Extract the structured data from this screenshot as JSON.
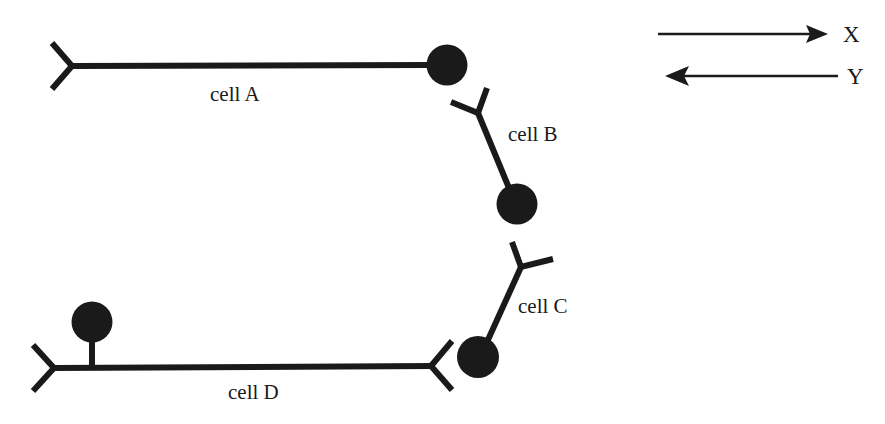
{
  "figure": {
    "background_color": "#ffffff",
    "ink_color": "#1a1a1a",
    "width": 885,
    "height": 424
  },
  "cells": [
    {
      "id": "cell-a",
      "label": "cell A",
      "label_x": 210,
      "label_y": 101,
      "soma": {
        "cx": 447,
        "cy": 65,
        "r": 20.5
      },
      "process": {
        "x1": 72,
        "y1": 66,
        "x2": 432,
        "y2": 65
      },
      "fork": {
        "vertex_x": 72,
        "vertex_y": 66,
        "arm1_x": 52,
        "arm1_y": 43,
        "arm2_x": 52,
        "arm2_y": 89
      }
    },
    {
      "id": "cell-b",
      "label": "cell B",
      "label_x": 508,
      "label_y": 141,
      "soma": {
        "cx": 517,
        "cy": 204,
        "r": 20.5
      },
      "process": {
        "x1": 478,
        "y1": 113,
        "x2": 509,
        "y2": 186
      },
      "fork": {
        "vertex_x": 478,
        "vertex_y": 113,
        "arm1_x": 487,
        "arm1_y": 88,
        "arm2_x": 451,
        "arm2_y": 102
      }
    },
    {
      "id": "cell-c",
      "label": "cell C",
      "label_x": 518,
      "label_y": 313,
      "soma": {
        "cx": 478,
        "cy": 357,
        "r": 21
      },
      "process": {
        "x1": 521,
        "y1": 267,
        "x2": 489,
        "y2": 340
      },
      "fork": {
        "vertex_x": 521,
        "vertex_y": 267,
        "arm1_x": 512,
        "arm1_y": 242,
        "arm2_x": 553,
        "arm2_y": 259
      }
    },
    {
      "id": "cell-d",
      "label": "cell D",
      "label_x": 228,
      "label_y": 399,
      "soma": {
        "cx": 92,
        "cy": 322,
        "r": 20.5
      },
      "stalk": {
        "x1": 92,
        "y1": 342,
        "x2": 92,
        "y2": 368
      },
      "process": {
        "x1": 54,
        "y1": 368,
        "x2": 432,
        "y2": 366
      },
      "fork": {
        "vertex_x": 54,
        "vertex_y": 368,
        "arm1_x": 33,
        "arm1_y": 345,
        "arm2_x": 33,
        "arm2_y": 391
      },
      "terminal_fork": {
        "vertex_x": 431,
        "vertex_y": 366,
        "arm1_x": 452,
        "arm1_y": 341,
        "arm2_x": 452,
        "arm2_y": 390
      }
    }
  ],
  "axes": [
    {
      "id": "axis-x",
      "label": "X",
      "direction": "right",
      "line_x1": 658,
      "line_x2": 828,
      "line_y": 34,
      "label_x": 843,
      "label_y": 42
    },
    {
      "id": "axis-y",
      "label": "Y",
      "direction": "left",
      "line_x1": 838,
      "line_x2": 665,
      "line_y": 76,
      "label_x": 847,
      "label_y": 84
    }
  ]
}
